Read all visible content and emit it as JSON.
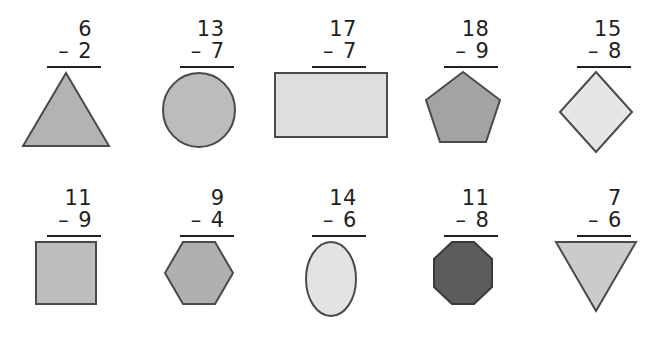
{
  "worksheet": {
    "title": "Subtraction problems with shapes",
    "background_color": "#ffffff",
    "text_color": "#231f20",
    "rule_color": "#231f20",
    "shape_outline_color": "#4a4a4a",
    "columns": 5,
    "rows": 2
  },
  "problems": [
    {
      "id": "problem-1",
      "minuend": "6",
      "operator": "–",
      "subtrahend": "2",
      "shape": "triangle",
      "fill": "#b3b3b3"
    },
    {
      "id": "problem-2",
      "minuend": "13",
      "operator": "–",
      "subtrahend": "7",
      "shape": "circle",
      "fill": "#bcbcbc"
    },
    {
      "id": "problem-3",
      "minuend": "17",
      "operator": "–",
      "subtrahend": "7",
      "shape": "rectangle",
      "fill": "#dedede"
    },
    {
      "id": "problem-4",
      "minuend": "18",
      "operator": "–",
      "subtrahend": "9",
      "shape": "pentagon",
      "fill": "#a3a3a3"
    },
    {
      "id": "problem-5",
      "minuend": "15",
      "operator": "–",
      "subtrahend": "8",
      "shape": "diamond",
      "fill": "#e6e6e6"
    },
    {
      "id": "problem-6",
      "minuend": "11",
      "operator": "–",
      "subtrahend": "9",
      "shape": "square",
      "fill": "#bdbdbd"
    },
    {
      "id": "problem-7",
      "minuend": "9",
      "operator": "–",
      "subtrahend": "4",
      "shape": "hexagon",
      "fill": "#b0b0b0"
    },
    {
      "id": "problem-8",
      "minuend": "14",
      "operator": "–",
      "subtrahend": "6",
      "shape": "ellipse",
      "fill": "#e3e3e3"
    },
    {
      "id": "problem-9",
      "minuend": "11",
      "operator": "–",
      "subtrahend": "8",
      "shape": "octagon",
      "fill": "#5c5c5c"
    },
    {
      "id": "problem-10",
      "minuend": "7",
      "operator": "–",
      "subtrahend": "6",
      "shape": "inverted-triangle",
      "fill": "#cbcbcb"
    }
  ]
}
